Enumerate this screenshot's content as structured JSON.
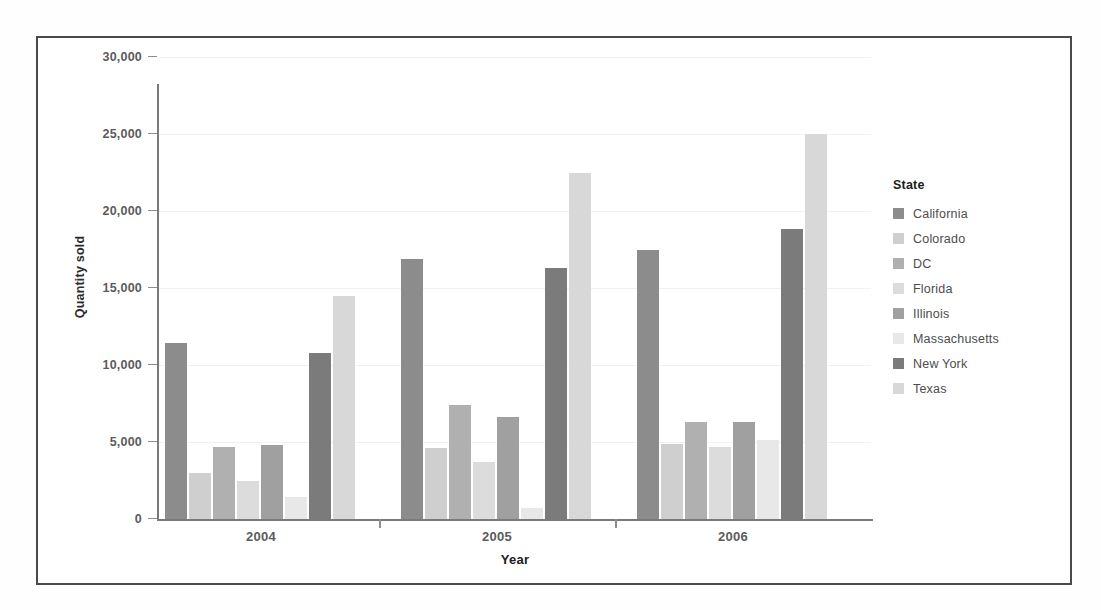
{
  "chart_data": {
    "type": "bar",
    "title": "",
    "xlabel": "Year",
    "ylabel": "Quantity sold",
    "ylim": [
      0,
      30000
    ],
    "yticks": [
      0,
      5000,
      10000,
      15000,
      20000,
      25000,
      30000
    ],
    "ytick_labels": [
      "0",
      "5,000",
      "10,000",
      "15,000",
      "20,000",
      "25,000",
      "30,000"
    ],
    "categories": [
      "2004",
      "2005",
      "2006"
    ],
    "legend_title": "State",
    "legend_position": "right",
    "grid": false,
    "series": [
      {
        "name": "California",
        "color": "#8c8c8c",
        "values": [
          11400,
          16900,
          17500
        ]
      },
      {
        "name": "Colorado",
        "color": "#cfcfcf",
        "values": [
          3000,
          4600,
          4900
        ]
      },
      {
        "name": "DC",
        "color": "#b0b0b0",
        "values": [
          4700,
          7400,
          6300
        ]
      },
      {
        "name": "Florida",
        "color": "#dcdcdc",
        "values": [
          2500,
          3700,
          4700
        ]
      },
      {
        "name": "Illinois",
        "color": "#a0a0a0",
        "values": [
          4800,
          6600,
          6300
        ]
      },
      {
        "name": "Massachusetts",
        "color": "#e8e8e8",
        "values": [
          1400,
          700,
          5100
        ]
      },
      {
        "name": "New York",
        "color": "#7b7b7b",
        "values": [
          10800,
          16300,
          18800
        ]
      },
      {
        "name": "Texas",
        "color": "#d8d8d8",
        "values": [
          14500,
          22500,
          25000
        ]
      }
    ]
  },
  "axis": {
    "x_title": "Year",
    "y_title": "Quantity sold"
  },
  "legend": {
    "title": "State"
  }
}
